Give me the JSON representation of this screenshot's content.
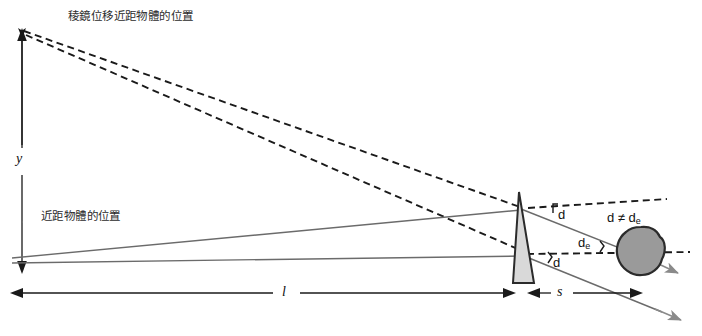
{
  "figure": {
    "title_visible": false,
    "background_color": "#ffffff",
    "width": 702,
    "height": 336
  },
  "labels": {
    "prism_shifted_object_position": "稜鏡位移近距物體的位置",
    "near_object_position": "近距物體的位置",
    "vertical_distance": "y",
    "distance_l": "l",
    "distance_s": "s",
    "angle_d_upper": "d",
    "angle_d_lower": "d",
    "angle_de": "d",
    "angle_de_sub": "e",
    "inequality": "d ≠ d",
    "inequality_sub": "e"
  },
  "colors": {
    "line_dark": "#1a1a1a",
    "line_gray": "#6b6b6b",
    "prism_fill": "#d9d9d9",
    "prism_stroke": "#2b2b2b",
    "eye_fill": "#9a9a9a",
    "eye_stroke": "#2b2b2b",
    "arrow_gray": "#8a8a8a",
    "text": "#1a1a1a"
  },
  "elements": {
    "prism": {
      "name": "prism",
      "apex_x": 519,
      "apex_y": 192,
      "base_y": 283
    },
    "eye": {
      "name": "eye-circle",
      "center_x": 641,
      "center_y": 251,
      "radius": 24
    },
    "dimension_l": {
      "from_x": 10,
      "to_x": 516,
      "y": 293
    },
    "dimension_s": {
      "from_x": 525,
      "to_x": 641,
      "y": 293
    },
    "axis_y": {
      "x": 22,
      "top_y": 33,
      "bottom_y": 272
    }
  }
}
